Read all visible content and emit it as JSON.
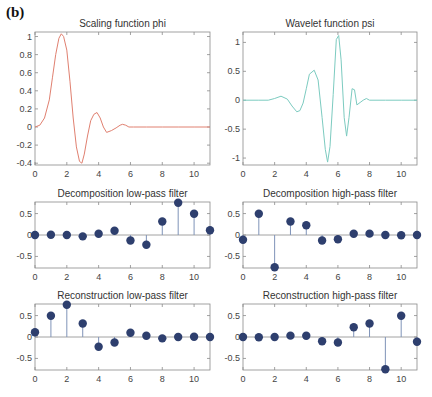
{
  "figure": {
    "panel_label": "(b)"
  },
  "chart_data": [
    {
      "type": "line",
      "title": "Scaling function phi",
      "xlabel": "",
      "ylabel": "",
      "xlim": [
        0,
        11
      ],
      "ylim": [
        -0.42,
        1.05
      ],
      "xticks": [
        0,
        2,
        4,
        6,
        8,
        10
      ],
      "yticks": [
        -0.4,
        -0.2,
        0,
        0.2,
        0.4,
        0.6,
        0.8,
        1
      ],
      "ytick_labels": [
        "-0.4",
        "-0.2",
        "0",
        "0.2",
        "0.4",
        "0.6",
        "0.8",
        "1"
      ],
      "color": "#e08070",
      "x": [
        0,
        0.3,
        0.6,
        0.9,
        1.1,
        1.3,
        1.5,
        1.65,
        1.8,
        2.0,
        2.2,
        2.4,
        2.6,
        2.8,
        2.95,
        3.1,
        3.3,
        3.5,
        3.7,
        3.9,
        4.1,
        4.3,
        4.5,
        4.8,
        5.1,
        5.35,
        5.5,
        5.7,
        5.9,
        6.2,
        7,
        8,
        9,
        10,
        11
      ],
      "y": [
        0,
        0.02,
        0.1,
        0.3,
        0.55,
        0.8,
        0.98,
        1.03,
        1.0,
        0.85,
        0.5,
        0.1,
        -0.22,
        -0.38,
        -0.4,
        -0.3,
        -0.1,
        0.07,
        0.14,
        0.16,
        0.1,
        0.0,
        -0.06,
        -0.04,
        -0.01,
        0.02,
        0.03,
        0.02,
        0.0,
        0.0,
        0.0,
        0.0,
        0.0,
        0.0,
        0.0
      ]
    },
    {
      "type": "line",
      "title": "Wavelet function psi",
      "xlabel": "",
      "ylabel": "",
      "xlim": [
        0,
        11
      ],
      "ylim": [
        -1.12,
        1.18
      ],
      "xticks": [
        0,
        2,
        4,
        6,
        8,
        10
      ],
      "yticks": [
        -1,
        -0.5,
        0,
        0.5,
        1
      ],
      "ytick_labels": [
        "-1",
        "-0.5",
        "0",
        "0.5",
        "1"
      ],
      "color": "#7ccbc0",
      "x": [
        0,
        1,
        1.6,
        2.0,
        2.4,
        2.8,
        3.1,
        3.4,
        3.6,
        3.8,
        4.0,
        4.2,
        4.5,
        4.75,
        5.0,
        5.2,
        5.35,
        5.5,
        5.7,
        5.9,
        6.05,
        6.2,
        6.4,
        6.55,
        6.7,
        6.9,
        7.05,
        7.2,
        7.4,
        7.6,
        7.8,
        8.0,
        9,
        10,
        11
      ],
      "y": [
        0,
        0,
        0.0,
        0.03,
        0.07,
        0.02,
        -0.1,
        -0.2,
        -0.18,
        -0.05,
        0.2,
        0.45,
        0.52,
        0.35,
        -0.3,
        -0.85,
        -1.07,
        -0.8,
        0.1,
        1.05,
        1.12,
        0.7,
        -0.3,
        -0.62,
        -0.3,
        0.2,
        0.18,
        -0.08,
        -0.04,
        0.0,
        0.03,
        0.0,
        0.0,
        0.0,
        0.0
      ]
    },
    {
      "type": "stem",
      "title": "Decomposition low-pass filter",
      "xlim": [
        0,
        11
      ],
      "ylim": [
        -0.77,
        0.77
      ],
      "xticks": [
        0,
        2,
        4,
        6,
        8,
        10
      ],
      "yticks": [
        -0.5,
        0,
        0.5
      ],
      "ytick_labels": [
        "-0.5",
        "0",
        "0.5"
      ],
      "x": [
        0,
        1,
        2,
        3,
        4,
        5,
        6,
        7,
        8,
        9,
        10,
        11
      ],
      "y": [
        -0.0011,
        0.0048,
        0.0006,
        -0.0316,
        0.0275,
        0.0975,
        -0.1298,
        -0.2263,
        0.3153,
        0.7511,
        0.4946,
        0.1115
      ]
    },
    {
      "type": "stem",
      "title": "Decomposition high-pass filter",
      "xlim": [
        0,
        11
      ],
      "ylim": [
        -0.77,
        0.77
      ],
      "xticks": [
        0,
        2,
        4,
        6,
        8,
        10
      ],
      "yticks": [
        -0.5,
        0,
        0.5
      ],
      "ytick_labels": [
        "-0.5",
        "0",
        "0.5"
      ],
      "x": [
        0,
        1,
        2,
        3,
        4,
        5,
        6,
        7,
        8,
        9,
        10,
        11
      ],
      "y": [
        -0.1115,
        0.4946,
        -0.7511,
        0.3153,
        0.2263,
        -0.1298,
        -0.0975,
        0.0275,
        0.0316,
        0.0006,
        -0.0048,
        -0.0011
      ]
    },
    {
      "type": "stem",
      "title": "Reconstruction low-pass filter",
      "xlim": [
        0,
        11
      ],
      "ylim": [
        -0.77,
        0.77
      ],
      "xticks": [
        0,
        2,
        4,
        6,
        8,
        10
      ],
      "yticks": [
        -0.5,
        0,
        0.5
      ],
      "ytick_labels": [
        "-0.5",
        "0",
        "0.5"
      ],
      "x": [
        0,
        1,
        2,
        3,
        4,
        5,
        6,
        7,
        8,
        9,
        10,
        11
      ],
      "y": [
        0.1115,
        0.4946,
        0.7511,
        0.3153,
        -0.2263,
        -0.1298,
        0.0975,
        0.0275,
        -0.0316,
        0.0006,
        0.0048,
        -0.0011
      ]
    },
    {
      "type": "stem",
      "title": "Reconstruction high-pass filter",
      "xlim": [
        0,
        11
      ],
      "ylim": [
        -0.77,
        0.77
      ],
      "xticks": [
        0,
        2,
        4,
        6,
        8,
        10
      ],
      "yticks": [
        -0.5,
        0,
        0.5
      ],
      "ytick_labels": [
        "-0.5",
        "0",
        "0.5"
      ],
      "x": [
        0,
        1,
        2,
        3,
        4,
        5,
        6,
        7,
        8,
        9,
        10,
        11
      ],
      "y": [
        -0.0011,
        -0.0048,
        0.0006,
        0.0316,
        0.0275,
        -0.0975,
        -0.1298,
        0.2263,
        0.3153,
        -0.7511,
        0.4946,
        -0.1115
      ]
    }
  ],
  "style": {
    "axis_color": "#8a8a8a",
    "tick_label_color": "#444444",
    "title_color": "#333333",
    "stem_marker_color": "#2e3f6e",
    "stem_line_color": "#7f93b8",
    "baseline_color": "#8a8a8a"
  }
}
